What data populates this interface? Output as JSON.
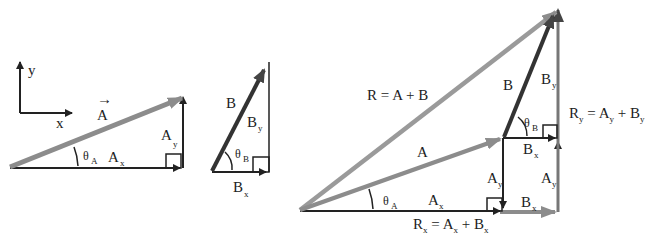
{
  "colors": {
    "vector_gray": "#8c8c8c",
    "vector_dark": "#333333",
    "component_line": "#222222",
    "background": "#ffffff"
  },
  "axes": {
    "x_label": "x",
    "y_label": "y"
  },
  "panel_a": {
    "vector": "A",
    "x_component": "A",
    "x_sub": "x",
    "y_component": "A",
    "y_sub": "y",
    "angle": "θ",
    "angle_sub": "A"
  },
  "panel_b": {
    "vector": "B",
    "x_component": "B",
    "x_sub": "x",
    "y_component": "B",
    "y_sub": "y",
    "angle": "θ",
    "angle_sub": "B"
  },
  "panel_sum": {
    "resultant_eq": {
      "r": "R",
      "eq": "=",
      "a": "A",
      "plus": "+",
      "b": "B"
    },
    "vector_a": "A",
    "vector_b": "B",
    "by": {
      "main": "B",
      "sub": "y"
    },
    "bx_top": {
      "main": "B",
      "sub": "x"
    },
    "ay_left": {
      "main": "A",
      "sub": "y"
    },
    "ay_right": {
      "main": "A",
      "sub": "y"
    },
    "ax": {
      "main": "A",
      "sub": "x"
    },
    "bx_bottom": {
      "main": "B",
      "sub": "x"
    },
    "theta_a": {
      "main": "θ",
      "sub": "A"
    },
    "theta_b": {
      "main": "θ",
      "sub": "B"
    },
    "rx_eq": {
      "r": "R",
      "rsub": "x",
      "eq": "=",
      "a": "A",
      "asub": "x",
      "plus": "+",
      "b": "B",
      "bsub": "x"
    },
    "ry_eq": {
      "r": "R",
      "rsub": "y",
      "eq": "=",
      "a": "A",
      "asub": "y",
      "plus": "+",
      "b": "B",
      "bsub": "y"
    }
  }
}
